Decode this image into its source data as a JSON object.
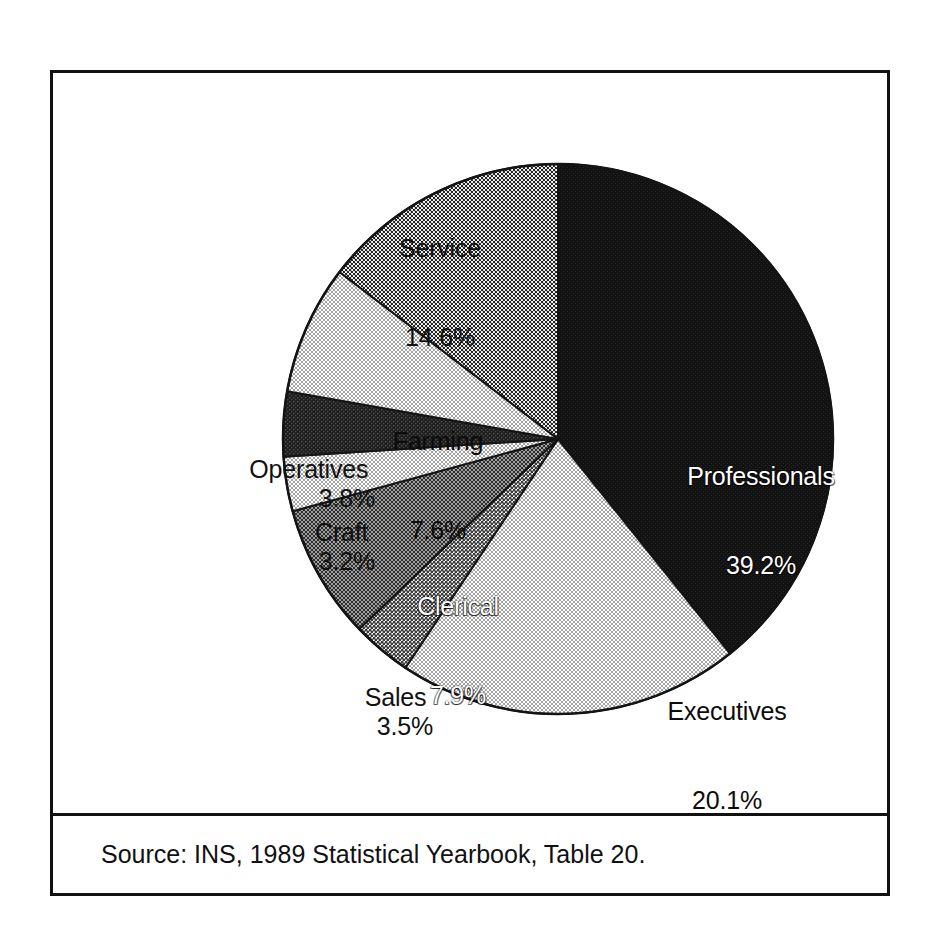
{
  "figure": {
    "source_note": "Source: INS, 1989 Statistical Yearbook, Table 20."
  },
  "chart_data": {
    "type": "pie",
    "title": "",
    "subtitle": "",
    "xlabel": "",
    "ylabel": "",
    "legend_position": "none",
    "labels_position": "slice-callouts",
    "units": "percent",
    "total": 99.9,
    "categories": [
      "Professionals",
      "Executives",
      "Sales",
      "Clerical",
      "Craft",
      "Operatives",
      "Farming",
      "Service"
    ],
    "values": [
      39.2,
      20.1,
      3.5,
      7.9,
      3.2,
      3.8,
      7.6,
      14.6
    ],
    "slices": [
      {
        "name": "Professionals",
        "value": 39.2,
        "value_text": "39.2%",
        "label_text": "Professionals",
        "fill": "solid-black",
        "fill_color": "#111111",
        "label_placement": "inside",
        "label_color": "#ffffff"
      },
      {
        "name": "Executives",
        "value": 20.1,
        "value_text": "20.1%",
        "label_text": "Executives",
        "fill": "fine-dot-light",
        "fill_color": "#d9d9d9",
        "label_placement": "inside",
        "label_color": "#111111"
      },
      {
        "name": "Sales",
        "value": 3.5,
        "value_text": "3.5%",
        "label_text": "Sales",
        "fill": "mid-gray",
        "fill_color": "#8f8f8f",
        "label_placement": "outside",
        "label_color": "#111111"
      },
      {
        "name": "Clerical",
        "value": 7.9,
        "value_text": "7.9%",
        "label_text": "Clerical",
        "fill": "dark-dot",
        "fill_color": "#4a4a4a",
        "label_placement": "inside",
        "label_color": "#ffffff"
      },
      {
        "name": "Craft",
        "value": 3.2,
        "value_text": "3.2%",
        "label_text": "Craft",
        "fill": "fine-dot-light",
        "fill_color": "#d9d9d9",
        "label_placement": "outside",
        "label_color": "#111111"
      },
      {
        "name": "Operatives",
        "value": 3.8,
        "value_text": "3.8%",
        "label_text": "Operatives",
        "fill": "near-black",
        "fill_color": "#2b2b2b",
        "label_placement": "outside",
        "label_color": "#111111"
      },
      {
        "name": "Farming",
        "value": 7.6,
        "value_text": "7.6%",
        "label_text": "Farming",
        "fill": "fine-dot-light",
        "fill_color": "#d9d9d9",
        "label_placement": "inside",
        "label_color": "#111111"
      },
      {
        "name": "Service",
        "value": 14.6,
        "value_text": "14.6%",
        "label_text": "Service",
        "fill": "mid-dot",
        "fill_color": "#9c9c9c",
        "label_placement": "outside",
        "label_color": "#111111"
      }
    ]
  },
  "labels": {
    "service": {
      "name": "Service",
      "value": "14.6%"
    },
    "professionals": {
      "name": "Professionals",
      "value": "39.2%"
    },
    "executives": {
      "name": "Executives",
      "value": "20.1%"
    },
    "farming": {
      "name": "Farming",
      "value": "7.6%"
    },
    "operatives": {
      "name": "Operatives ",
      "value": "3.8%"
    },
    "craft": {
      "name": "Craft ",
      "value": "3.2%"
    },
    "clerical": {
      "name": "Clerical",
      "value": "7.9%"
    },
    "sales": {
      "name": "Sales ",
      "value": "3.5%"
    }
  }
}
